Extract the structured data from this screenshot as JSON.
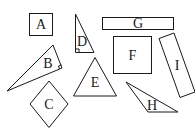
{
  "diagram": {
    "title": "",
    "stroke_color": "#1a1a1a",
    "background": "#ffffff",
    "shapes": [
      {
        "id": "A",
        "label": "A",
        "type": "square"
      },
      {
        "id": "B",
        "label": "B",
        "type": "right-triangle"
      },
      {
        "id": "C",
        "label": "C",
        "type": "rhombus"
      },
      {
        "id": "D",
        "label": "D",
        "type": "right-triangle"
      },
      {
        "id": "E",
        "label": "E",
        "type": "triangle"
      },
      {
        "id": "F",
        "label": "F",
        "type": "square"
      },
      {
        "id": "G",
        "label": "G",
        "type": "rectangle"
      },
      {
        "id": "H",
        "label": "H",
        "type": "obtuse-triangle"
      },
      {
        "id": "I",
        "label": "I",
        "type": "rectangle"
      }
    ]
  }
}
